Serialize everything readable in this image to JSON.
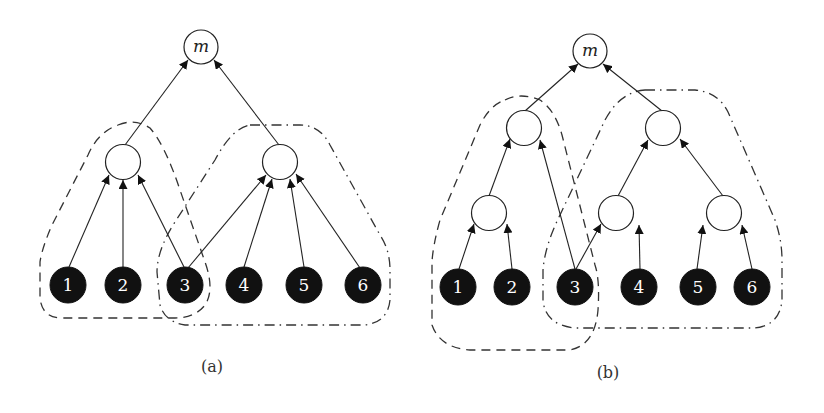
{
  "figure": {
    "panels": [
      {
        "id": "a",
        "caption": "(a)",
        "root_label": "m",
        "leaves": [
          "1",
          "2",
          "3",
          "4",
          "5",
          "6"
        ],
        "groups": [
          {
            "style": "dashed",
            "members": [
              "1",
              "2",
              "3"
            ]
          },
          {
            "style": "dash-dot",
            "members": [
              "3",
              "4",
              "5",
              "6"
            ]
          }
        ]
      },
      {
        "id": "b",
        "caption": "(b)",
        "root_label": "m",
        "leaves": [
          "1",
          "2",
          "3",
          "4",
          "5",
          "6"
        ],
        "groups": [
          {
            "style": "dashed",
            "members": [
              "1",
              "2",
              "3"
            ]
          },
          {
            "style": "dash-dot",
            "members": [
              "3",
              "4",
              "5",
              "6"
            ]
          }
        ]
      }
    ]
  }
}
